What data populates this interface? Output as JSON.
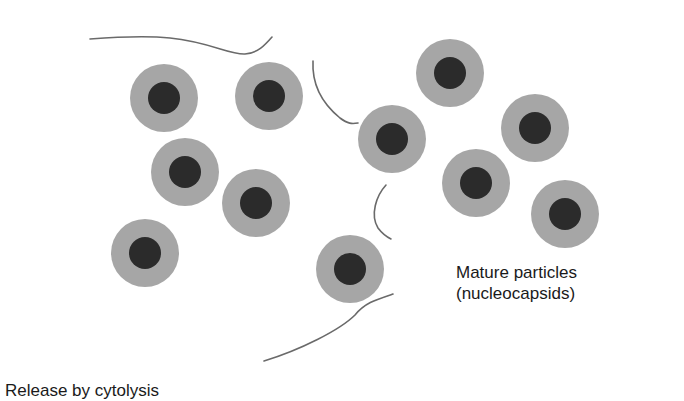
{
  "diagram": {
    "labels": {
      "mature_particles_line1": "Mature particles",
      "mature_particles_line2": "(nucleocapsids)",
      "release_by_cytolysis": "Release by cytolysis"
    },
    "colors": {
      "background": "#ffffff",
      "particle_outer": "#a6a6a6",
      "particle_core": "#2b2b2b",
      "membrane_line": "#6a6a6a",
      "text": "#1a1a1a"
    },
    "particle_geometry": {
      "outer_radius": 34,
      "core_radius": 16
    },
    "particles": [
      {
        "x": 164,
        "y": 98
      },
      {
        "x": 269,
        "y": 96
      },
      {
        "x": 185,
        "y": 172
      },
      {
        "x": 256,
        "y": 203
      },
      {
        "x": 145,
        "y": 253
      },
      {
        "x": 392,
        "y": 139
      },
      {
        "x": 350,
        "y": 269
      },
      {
        "x": 450,
        "y": 73
      },
      {
        "x": 535,
        "y": 128
      },
      {
        "x": 476,
        "y": 183
      },
      {
        "x": 565,
        "y": 214
      }
    ],
    "membrane_fragments": [
      "M 90 39 C 130 36, 150 36, 170 38 C 210 42, 230 55, 245 54 C 258 53, 265 45, 272 37",
      "M 313 61 C 312 80, 318 100, 340 118 C 348 124, 352 124, 358 123",
      "M 386 185 C 376 196, 370 215, 378 228 C 381 232, 385 236, 391 239",
      "M 264 361 C 300 350, 340 330, 355 315 C 365 303, 375 300, 393 294"
    ]
  }
}
